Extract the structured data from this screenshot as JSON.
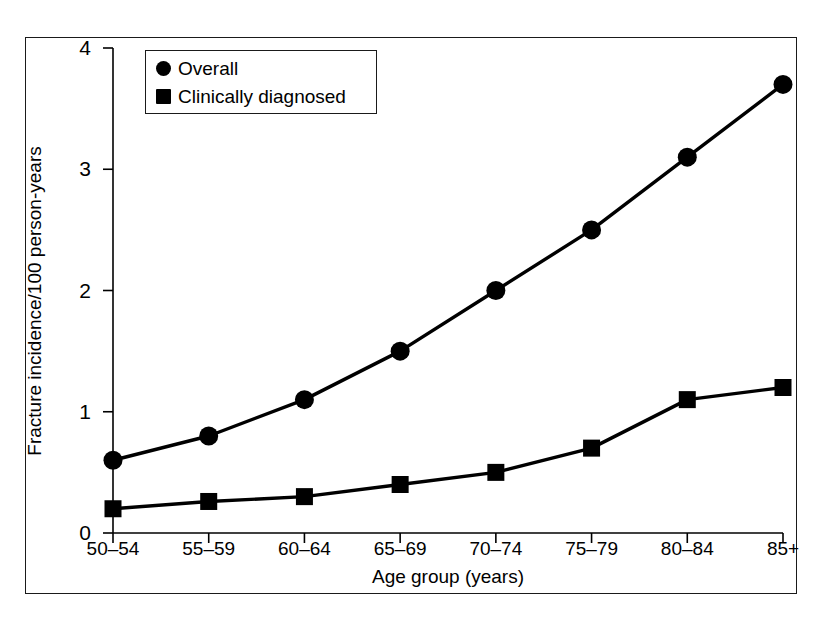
{
  "chart_data": {
    "type": "line",
    "title": "",
    "subtitle": "",
    "xlabel": "Age group (years)",
    "ylabel": "Fracture incidence/100 person-years",
    "categories": [
      "50–54",
      "55–59",
      "60–64",
      "65–69",
      "70–74",
      "75–79",
      "80–84",
      "85+"
    ],
    "series": [
      {
        "name": "Overall",
        "marker": "circle",
        "color": "#000000",
        "values": [
          0.6,
          0.8,
          1.1,
          1.5,
          2.0,
          2.5,
          3.1,
          3.7
        ]
      },
      {
        "name": "Clinically diagnosed",
        "marker": "square",
        "color": "#000000",
        "values": [
          0.2,
          0.26,
          0.3,
          0.4,
          0.5,
          0.7,
          1.1,
          1.2
        ]
      }
    ],
    "ylim": [
      0,
      4
    ],
    "yticks": [
      0,
      1,
      2,
      3,
      4
    ],
    "ytick_labels": [
      "0",
      "1",
      "2",
      "3",
      "4"
    ],
    "grid": false,
    "legend_position": "top-left",
    "axis_color": "#000000",
    "frame_color": "#1a1a1a",
    "background": "#ffffff"
  },
  "legend": {
    "entries": [
      {
        "label": "Overall",
        "marker": "circle"
      },
      {
        "label": "Clinically diagnosed",
        "marker": "square"
      }
    ]
  }
}
